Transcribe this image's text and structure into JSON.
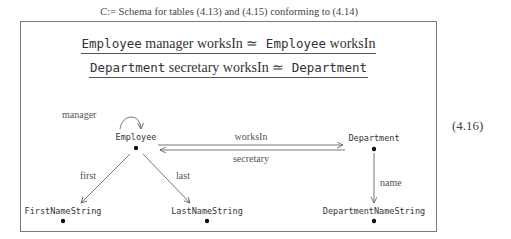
{
  "caption": {
    "symbol": "C",
    "text": ":= Schema for tables (4.13) and (4.15) conforming to (4.14)"
  },
  "equation_number": "(4.16)",
  "path_equivalences": [
    {
      "lhs_object": "Employee",
      "lhs_path": " manager worksIn ",
      "relation": "≃",
      "rhs_object": " Employee",
      "rhs_path": " worksIn"
    },
    {
      "lhs_object": "Department",
      "lhs_path": " secretary worksIn ",
      "relation": "≃",
      "rhs_object": " Department",
      "rhs_path": ""
    }
  ],
  "nodes": [
    {
      "id": "employee",
      "label": "Employee",
      "x": 136,
      "y": 147
    },
    {
      "id": "department",
      "label": "Department",
      "x": 374,
      "y": 148
    },
    {
      "id": "firstnamestring",
      "label": "FirstNameString",
      "x": 63,
      "y": 220
    },
    {
      "id": "lastnamestring",
      "label": "LastNameString",
      "x": 207,
      "y": 220
    },
    {
      "id": "departmentnamestring",
      "label": "DepartmentNameString",
      "x": 374,
      "y": 220
    }
  ],
  "edges": [
    {
      "id": "manager",
      "label": "manager",
      "from": "Employee",
      "to": "Employee"
    },
    {
      "id": "worksIn",
      "label": "worksIn",
      "from": "Employee",
      "to": "Department"
    },
    {
      "id": "secretary",
      "label": "secretary",
      "from": "Department",
      "to": "Employee"
    },
    {
      "id": "first",
      "label": "first",
      "from": "Employee",
      "to": "FirstNameString"
    },
    {
      "id": "last",
      "label": "last",
      "from": "Employee",
      "to": "LastNameString"
    },
    {
      "id": "name",
      "label": "name",
      "from": "Department",
      "to": "DepartmentNameString"
    }
  ],
  "colors": {
    "line": "#666666",
    "node": "#111111",
    "frame": "#7a7a7a"
  }
}
